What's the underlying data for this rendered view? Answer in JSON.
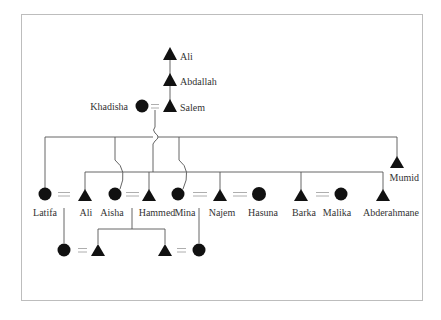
{
  "diagram": {
    "type": "kinship-genealogy",
    "legend_symbols": {
      "male": "triangle",
      "female": "circle",
      "marriage": "double-line (=)"
    },
    "colors": {
      "symbol": "#111111",
      "line": "#555555",
      "frame": "#bdbdbd",
      "text": "#333333"
    },
    "generation_1": [
      {
        "id": "ali_elder",
        "name": "Ali",
        "sex": "male"
      }
    ],
    "generation_2": [
      {
        "id": "abdallah",
        "name": "Abdallah",
        "sex": "male"
      }
    ],
    "generation_3": [
      {
        "id": "khadisha",
        "name": "Khadisha",
        "sex": "female"
      },
      {
        "id": "salem",
        "name": "Salem",
        "sex": "male"
      }
    ],
    "generation_4": [
      {
        "id": "latifa",
        "name": "Latifa",
        "sex": "female"
      },
      {
        "id": "ali",
        "name": "Ali",
        "sex": "male"
      },
      {
        "id": "aisha",
        "name": "Aisha",
        "sex": "female"
      },
      {
        "id": "hammed",
        "name": "Hammed",
        "sex": "male"
      },
      {
        "id": "mina",
        "name": "Mina",
        "sex": "female"
      },
      {
        "id": "najem",
        "name": "Najem",
        "sex": "male"
      },
      {
        "id": "hasuna",
        "name": "Hasuna",
        "sex": "female"
      },
      {
        "id": "barka",
        "name": "Barka",
        "sex": "male"
      },
      {
        "id": "malika",
        "name": "Malika",
        "sex": "female"
      },
      {
        "id": "abderahmane",
        "name": "Abderahmane",
        "sex": "male"
      },
      {
        "id": "mumid",
        "name": "Mumid",
        "sex": "male"
      }
    ],
    "generation_5": [
      {
        "id": "g5_f1",
        "name": "",
        "sex": "female"
      },
      {
        "id": "g5_m1",
        "name": "",
        "sex": "male"
      },
      {
        "id": "g5_m2",
        "name": "",
        "sex": "male"
      },
      {
        "id": "g5_f2",
        "name": "",
        "sex": "female"
      }
    ],
    "marriages": [
      [
        "khadisha",
        "salem"
      ],
      [
        "latifa",
        "ali"
      ],
      [
        "aisha",
        "hammed"
      ],
      [
        "mina",
        "najem"
      ],
      [
        "najem",
        "hasuna"
      ],
      [
        "barka",
        "malika"
      ],
      [
        "g5_f1",
        "g5_m1"
      ],
      [
        "g5_m2",
        "g5_f2"
      ]
    ],
    "descent": [
      [
        "ali_elder",
        "abdallah"
      ],
      [
        "abdallah",
        "salem"
      ],
      [
        "khadisha+salem",
        "latifa",
        "aisha",
        "mina",
        "mumid"
      ],
      [
        "salem",
        "ali",
        "hammed",
        "najem",
        "barka",
        "abderahmane"
      ],
      [
        "latifa+ali",
        "g5_f1"
      ],
      [
        "aisha+hammed",
        "g5_m1",
        "g5_m2"
      ],
      [
        "mina+najem",
        "g5_f2"
      ]
    ]
  }
}
